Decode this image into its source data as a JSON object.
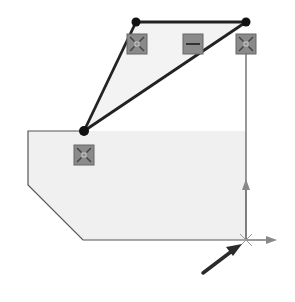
{
  "canvas": {
    "width": 295,
    "height": 302,
    "background": "#ffffff"
  },
  "colors": {
    "region_fill": "#f0f0f0",
    "outline": "#555555",
    "sketch_line": "#222222",
    "point": "#111111",
    "relation_icon_fill": "#8a8a8a",
    "relation_icon_border": "#666666",
    "origin_axis": "#777777",
    "cursor": "#2a2a2a"
  },
  "sketch": {
    "region_outline": [
      [
        28,
        131
      ],
      [
        84,
        131
      ],
      [
        136,
        22
      ],
      [
        246,
        22
      ],
      [
        246,
        240
      ],
      [
        83,
        240
      ],
      [
        28,
        185
      ]
    ],
    "lines": [
      {
        "name": "top-horizontal-line",
        "from": [
          136,
          22
        ],
        "to": [
          246,
          22
        ]
      },
      {
        "name": "left-slanted-line",
        "from": [
          136,
          22
        ],
        "to": [
          84,
          131
        ]
      },
      {
        "name": "diagonal-line",
        "from": [
          246,
          22
        ],
        "to": [
          84,
          131
        ]
      }
    ],
    "points": [
      [
        136,
        22
      ],
      [
        246,
        22
      ],
      [
        84,
        131
      ]
    ],
    "relations": [
      {
        "name": "coincident-relation-icon",
        "type": "coincident",
        "x": 137,
        "y": 44
      },
      {
        "name": "horizontal-relation-icon",
        "type": "horizontal",
        "x": 193,
        "y": 44
      },
      {
        "name": "coincident-relation-icon",
        "type": "coincident",
        "x": 246,
        "y": 44
      },
      {
        "name": "coincident-relation-icon",
        "type": "coincident",
        "x": 84,
        "y": 155
      }
    ]
  },
  "origin": {
    "x": 246,
    "y": 240,
    "y_axis_end": 180,
    "x_axis_end": 277
  },
  "cursor": {
    "from": [
      203,
      273
    ],
    "to": [
      241,
      245
    ]
  }
}
